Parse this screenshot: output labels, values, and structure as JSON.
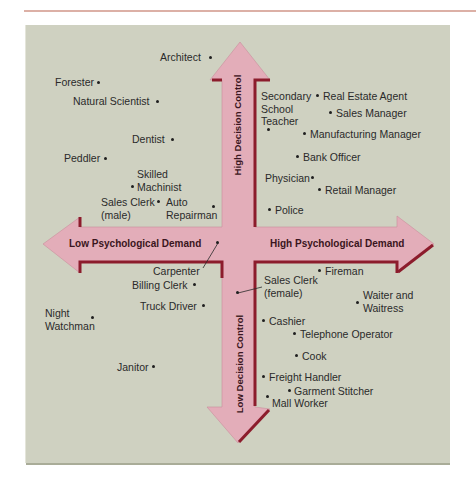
{
  "colors": {
    "panel": "#cfd1c1",
    "arrow_fill": "#e3adb9",
    "arrow_shadow": "#8c1c2c",
    "top_rule": "#dcb0a6",
    "label_text": "#2a2a2a",
    "axis_text": "#3a1520"
  },
  "axes": {
    "x_low": "Low Psychological Demand",
    "x_high": "High Psychological Demand",
    "y_high": "High Decision Control",
    "y_low": "Low Decision Control"
  },
  "occupations": [
    {
      "lines": [
        "Architect"
      ]
    },
    {
      "lines": [
        "Forester"
      ]
    },
    {
      "lines": [
        "Natural Scientist"
      ]
    },
    {
      "lines": [
        "Dentist"
      ]
    },
    {
      "lines": [
        "Peddler"
      ]
    },
    {
      "lines": [
        "Skilled",
        "Machinist"
      ]
    },
    {
      "lines": [
        "Sales Clerk",
        "(male)"
      ]
    },
    {
      "lines": [
        "Auto",
        "Repairman"
      ]
    },
    {
      "lines": [
        "Secondary",
        "School",
        "Teacher"
      ]
    },
    {
      "lines": [
        "Real Estate Agent"
      ]
    },
    {
      "lines": [
        "Sales Manager"
      ]
    },
    {
      "lines": [
        "Manufacturing Manager"
      ]
    },
    {
      "lines": [
        "Bank Officer"
      ]
    },
    {
      "lines": [
        "Physician"
      ]
    },
    {
      "lines": [
        "Retail Manager"
      ]
    },
    {
      "lines": [
        "Police"
      ]
    },
    {
      "lines": [
        "Carpenter"
      ]
    },
    {
      "lines": [
        "Billing Clerk"
      ]
    },
    {
      "lines": [
        "Truck Driver"
      ]
    },
    {
      "lines": [
        "Night",
        "Watchman"
      ]
    },
    {
      "lines": [
        "Janitor"
      ]
    },
    {
      "lines": [
        "Fireman"
      ]
    },
    {
      "lines": [
        "Sales Clerk",
        "(female)"
      ]
    },
    {
      "lines": [
        "Waiter and",
        "Waitress"
      ]
    },
    {
      "lines": [
        "Cashier"
      ]
    },
    {
      "lines": [
        "Telephone Operator"
      ]
    },
    {
      "lines": [
        "Cook"
      ]
    },
    {
      "lines": [
        "Freight Handler"
      ]
    },
    {
      "lines": [
        "Garment Stitcher"
      ]
    },
    {
      "lines": [
        "Mall Worker"
      ]
    }
  ]
}
